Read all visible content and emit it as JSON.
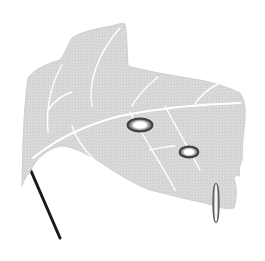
{
  "figure": {
    "background": "#ffffff",
    "colors": {
      "leaf_fill": "#d9d9d9",
      "leaf_edge": "#c4c4c4",
      "vein": "#ffffff",
      "petiole": "#1a1a1a",
      "lesion_ring": "#4a4a4a",
      "lesion_center": "#ffffff",
      "droplet_ring": "#5a5a5a"
    },
    "elements": [
      {
        "name": "leaf-blade",
        "type": "shape"
      },
      {
        "name": "midrib-vein",
        "type": "line"
      },
      {
        "name": "lateral-veins",
        "type": "lines"
      },
      {
        "name": "lesion-1",
        "type": "ellipse",
        "cx": 140,
        "cy": 125,
        "rx": 13,
        "ry": 7
      },
      {
        "name": "lesion-2",
        "type": "ellipse",
        "cx": 189,
        "cy": 152,
        "rx": 10,
        "ry": 6
      },
      {
        "name": "droplet",
        "type": "ellipse",
        "cx": 216,
        "cy": 203,
        "rx": 3,
        "ry": 20
      },
      {
        "name": "petiole",
        "type": "line",
        "x1": 31,
        "y1": 171,
        "x2": 60,
        "y2": 238
      }
    ]
  }
}
